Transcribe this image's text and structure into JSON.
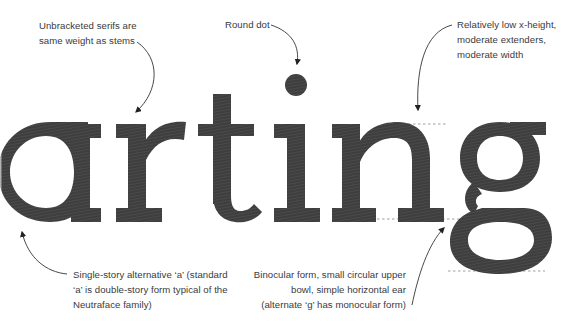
{
  "specimen": {
    "word": "arting",
    "glyph_color": "#3c3c3c",
    "line_color": "#8a8a8a",
    "arrow_color": "#333333"
  },
  "annotations": {
    "serifs": {
      "lines": [
        "Unbracketed serifs are",
        "same weight as stems"
      ]
    },
    "dot": {
      "lines": [
        "Round dot"
      ]
    },
    "xheight": {
      "lines": [
        "Relatively low x-height,",
        "moderate extenders,",
        "moderate width"
      ]
    },
    "single_story_a": {
      "lines": [
        "Single-story alternative ‘a’ (standard",
        "‘a’ is double-story form typical of the",
        "Neutraface family)"
      ]
    },
    "binocular_g": {
      "lines": [
        "Binocular form, small circular upper",
        "bowl, simple horizontal ear",
        "(alternate ‘g’ has monocular form)"
      ]
    }
  }
}
